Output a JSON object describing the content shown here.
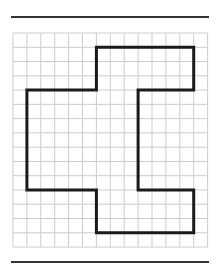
{
  "figure": {
    "type": "grid-polygon",
    "grid": {
      "cols": 14,
      "rows": 15,
      "origin_x": 13,
      "origin_y": 33,
      "cell_w": 13.9,
      "cell_h": 14.27,
      "line_color": "#cccccc"
    },
    "shape": {
      "stroke": "#1a1a1a",
      "stroke_width": 3,
      "vertices": [
        [
          6,
          1
        ],
        [
          13,
          1
        ],
        [
          13,
          4
        ],
        [
          9,
          4
        ],
        [
          9,
          11
        ],
        [
          13,
          11
        ],
        [
          13,
          14
        ],
        [
          6,
          14
        ],
        [
          6,
          11
        ],
        [
          1,
          11
        ],
        [
          1,
          4
        ],
        [
          6,
          4
        ]
      ]
    },
    "rules": {
      "top_y": 17,
      "bottom_y": 262,
      "color": "#333333"
    }
  }
}
